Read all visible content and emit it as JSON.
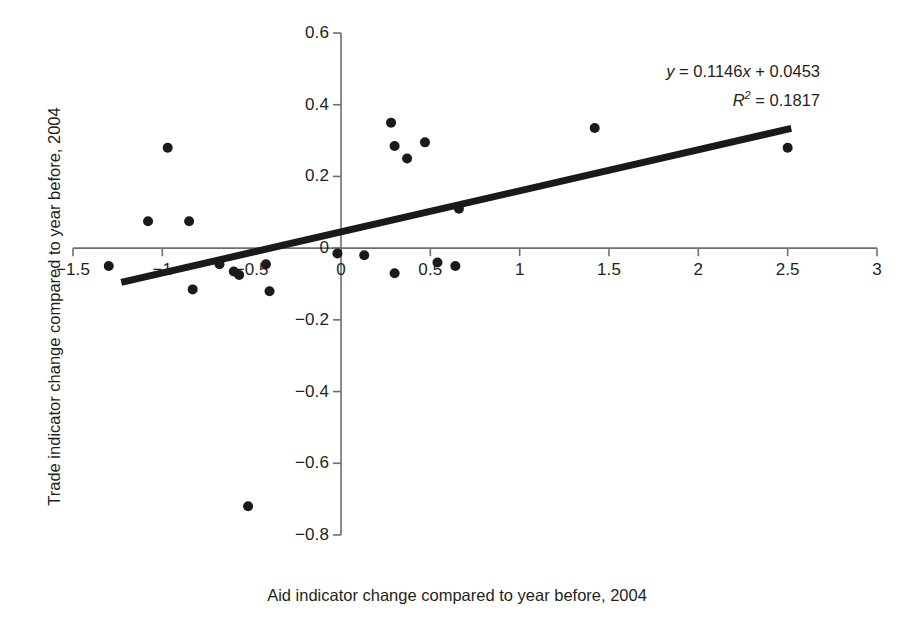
{
  "chart_data": {
    "type": "scatter",
    "title": "",
    "xlabel": "Aid indicator change compared to year before, 2004",
    "ylabel": "Trade indicator change compared to year before, 2004",
    "xlim": [
      -1.5,
      3
    ],
    "ylim": [
      -0.8,
      0.6
    ],
    "xticks": [
      "-1.5",
      "-1",
      "-0.5",
      "0",
      "0.5",
      "1",
      "1.5",
      "2",
      "2.5",
      "3"
    ],
    "xtick_values": [
      -1.5,
      -1,
      -0.5,
      0,
      0.5,
      1,
      1.5,
      2,
      2.5,
      3
    ],
    "yticks": [
      "0.6",
      "0.4",
      "0.2",
      "0",
      "-0.2",
      "-0.4",
      "-0.6",
      "-0.8"
    ],
    "ytick_values": [
      0.6,
      0.4,
      0.2,
      0,
      -0.2,
      -0.4,
      -0.6,
      -0.8
    ],
    "grid": false,
    "legend": null,
    "marker_color": "#1a1a1a",
    "marker_size": 7,
    "points": [
      {
        "x": -1.3,
        "y": -0.05
      },
      {
        "x": -1.08,
        "y": 0.075
      },
      {
        "x": -0.97,
        "y": 0.28
      },
      {
        "x": -0.85,
        "y": 0.075
      },
      {
        "x": -0.83,
        "y": -0.115
      },
      {
        "x": -0.68,
        "y": -0.045
      },
      {
        "x": -0.6,
        "y": -0.065
      },
      {
        "x": -0.57,
        "y": -0.075
      },
      {
        "x": -0.52,
        "y": -0.72
      },
      {
        "x": -0.42,
        "y": -0.045
      },
      {
        "x": -0.4,
        "y": -0.12
      },
      {
        "x": -0.02,
        "y": -0.015
      },
      {
        "x": 0.13,
        "y": -0.02
      },
      {
        "x": 0.28,
        "y": 0.35
      },
      {
        "x": 0.3,
        "y": 0.285
      },
      {
        "x": 0.3,
        "y": -0.07
      },
      {
        "x": 0.37,
        "y": 0.25
      },
      {
        "x": 0.47,
        "y": 0.295
      },
      {
        "x": 0.54,
        "y": -0.04
      },
      {
        "x": 0.64,
        "y": -0.05
      },
      {
        "x": 0.66,
        "y": 0.11
      },
      {
        "x": 1.42,
        "y": 0.335
      },
      {
        "x": 2.5,
        "y": 0.28
      }
    ],
    "trendline": {
      "slope": 0.1146,
      "intercept": 0.0453,
      "x_start": -1.23,
      "x_end": 2.52,
      "color": "#1a1a1a",
      "width": 7
    },
    "annotations": {
      "equation_y": "y",
      "equation_body": " = 0.1146",
      "equation_x": "x",
      "equation_tail": " + 0.0453",
      "r_symbol": "R",
      "r_exponent": "2",
      "r_value": " = 0.1817"
    }
  },
  "axes": {
    "x_title": "Aid indicator change compared to year before, 2004",
    "y_title": "Trade indicator change compared to year before, 2004"
  }
}
